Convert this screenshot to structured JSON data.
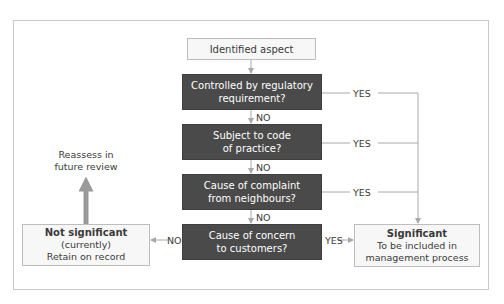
{
  "diagram": {
    "start": {
      "label": "Identified aspect"
    },
    "decisions": [
      {
        "line1": "Controlled by regulatory",
        "line2": "requirement?",
        "yes_label": "YES",
        "no_label": "NO"
      },
      {
        "line1": "Subject to code",
        "line2": "of practice?",
        "yes_label": "YES",
        "no_label": "NO"
      },
      {
        "line1": "Cause of complaint",
        "line2": "from neighbours?",
        "yes_label": "YES",
        "no_label": "NO"
      },
      {
        "line1": "Cause of concern",
        "line2": "to customers?",
        "yes_label": "YES",
        "no_label": "NO"
      }
    ],
    "not_significant": {
      "title": "Not significant",
      "line2": "(currently)",
      "line3": "Retain on record"
    },
    "significant": {
      "title": "Significant",
      "line2": "To be included in",
      "line3": "management process"
    },
    "reassess": {
      "line1": "Reassess in",
      "line2": "future review"
    },
    "colors": {
      "decision_fill": "#4a4a4a",
      "terminal_fill": "#f7f7f7",
      "connector": "#a8a8a8",
      "reassess_arrow": "#9a9a9a"
    }
  }
}
